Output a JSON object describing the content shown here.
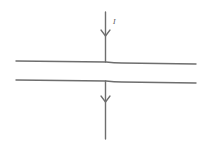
{
  "diagram": {
    "current_label": "I",
    "colors": {
      "stroke": "#6e6e6e",
      "background": "#ffffff"
    },
    "elements": [
      {
        "name": "upper-wire-segment",
        "direction": "down",
        "has_arrow": true
      },
      {
        "name": "slab-top-line"
      },
      {
        "name": "slab-bottom-line"
      },
      {
        "name": "lower-wire-segment",
        "direction": "down",
        "has_arrow": true
      }
    ]
  }
}
